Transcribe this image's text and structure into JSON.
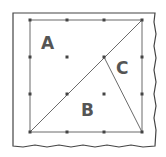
{
  "diagram": {
    "type": "grid-square-partition",
    "labels": [
      {
        "id": "A",
        "text": "A",
        "x": 51,
        "y": 49
      },
      {
        "id": "B",
        "text": "B",
        "x": 89,
        "y": 116
      },
      {
        "id": "C",
        "text": "C",
        "x": 124,
        "y": 74
      }
    ],
    "colors": {
      "line": "#6b6b6b",
      "dot": "#444444",
      "frame": "#444444",
      "label": "#555555"
    }
  }
}
